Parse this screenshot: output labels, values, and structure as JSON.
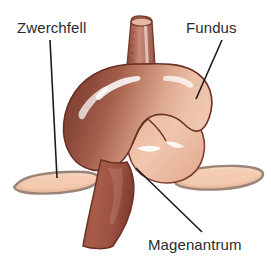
{
  "figure": {
    "language": "de",
    "background_color": "#ffffff",
    "width": 271,
    "height": 265
  },
  "labels": [
    {
      "id": "zwerchfell",
      "text": "Zwerchfell",
      "color": "#2b2b2b",
      "points_to": "diaphragm-left"
    },
    {
      "id": "fundus",
      "text": "Fundus",
      "color": "#2b2b2b",
      "points_to": "stomach-fundus"
    },
    {
      "id": "magenantrum",
      "text": "Magenantrum",
      "color": "#2b2b2b",
      "points_to": "stomach-antrum"
    }
  ],
  "leader_lines": [
    {
      "id": "leader-zwerchfell",
      "x1": 50,
      "y1": 40,
      "x2": 57,
      "y2": 178,
      "color": "#1d1d1d",
      "width": 1.6
    },
    {
      "id": "leader-fundus",
      "x1": 222,
      "y1": 40,
      "x2": 196,
      "y2": 99,
      "color": "#1d1d1d",
      "width": 1.6
    },
    {
      "id": "leader-magenantrum",
      "x1": 136,
      "y1": 168,
      "x2": 202,
      "y2": 232,
      "color": "#1d1d1d",
      "width": 1.6
    }
  ],
  "anatomy": {
    "parts": [
      {
        "id": "esophagus",
        "name": "Speiseröhre",
        "fill_light": "#c9897a",
        "fill_dark": "#9a5548"
      },
      {
        "id": "fundus",
        "name": "Fundus",
        "fill_light": "#eec4ae",
        "fill_dark": "#8d4c3e"
      },
      {
        "id": "antrum",
        "name": "Magenantrum",
        "fill_light": "#d9a593",
        "fill_dark": "#8b4536"
      },
      {
        "id": "duodenum",
        "name": "Zwölffingerdarm",
        "fill_light": "#a85a49",
        "fill_dark": "#8b4436"
      },
      {
        "id": "diaphragm-left",
        "name": "Zwerchfell links",
        "fill": "#f2c9b0",
        "stroke": "#9b8578"
      },
      {
        "id": "diaphragm-right",
        "name": "Zwerchfell rechts",
        "fill": "#f2c9b0",
        "stroke": "#9b8578"
      }
    ],
    "outline_color": "#6b3125",
    "highlight_color": "#ffffff"
  }
}
